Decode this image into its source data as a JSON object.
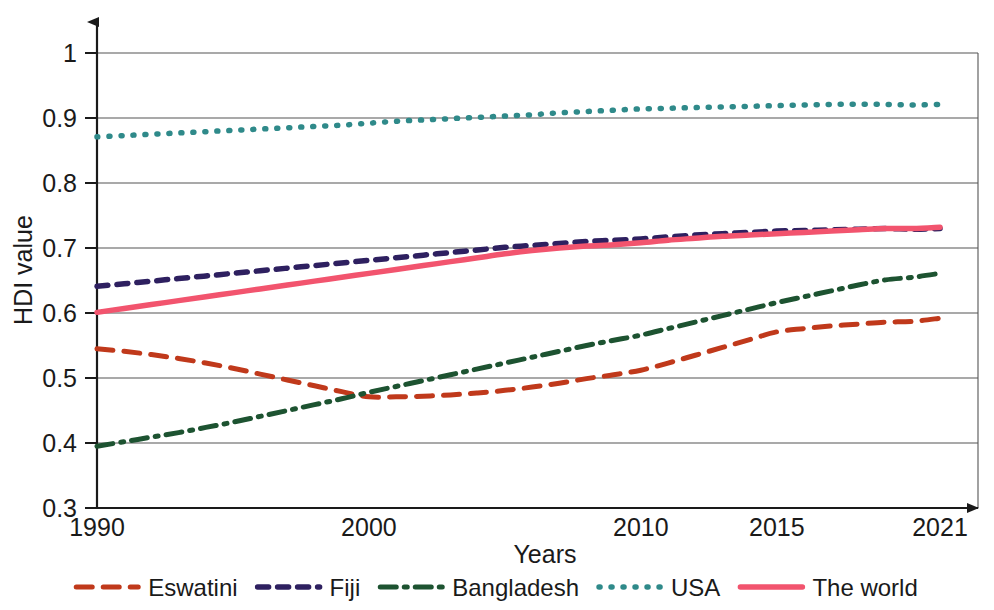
{
  "chart_data": {
    "type": "line",
    "title": "",
    "xlabel": "Years",
    "ylabel": "HDI value",
    "x": [
      1990,
      1991,
      1992,
      1993,
      1994,
      1995,
      1996,
      1997,
      1998,
      1999,
      2000,
      2001,
      2002,
      2003,
      2004,
      2005,
      2006,
      2007,
      2008,
      2009,
      2010,
      2011,
      2012,
      2013,
      2014,
      2015,
      2016,
      2017,
      2018,
      2019,
      2020,
      2021
    ],
    "x_tick_labels": [
      "1990",
      "2000",
      "2010",
      "2015",
      "2021"
    ],
    "x_tick_values": [
      1990,
      2000,
      2010,
      2015,
      2021
    ],
    "y_tick_labels": [
      "0.3",
      "0.4",
      "0.5",
      "0.6",
      "0.7",
      "0.8",
      "0.9",
      "1"
    ],
    "y_tick_values": [
      0.3,
      0.4,
      0.5,
      0.6,
      0.7,
      0.8,
      0.9,
      1.0
    ],
    "xlim": [
      1990,
      2021
    ],
    "ylim": [
      0.3,
      1.0
    ],
    "grid": true,
    "legend_position": "bottom",
    "series": [
      {
        "name": "Eswatini",
        "color": "#C0391B",
        "style": "dashed",
        "values": [
          0.545,
          0.541,
          0.536,
          0.53,
          0.523,
          0.515,
          0.506,
          0.497,
          0.488,
          0.479,
          0.471,
          0.471,
          0.472,
          0.474,
          0.477,
          0.481,
          0.486,
          0.492,
          0.499,
          0.505,
          0.512,
          0.523,
          0.535,
          0.547,
          0.559,
          0.571,
          0.576,
          0.58,
          0.583,
          0.586,
          0.587,
          0.592
        ]
      },
      {
        "name": "Fiji",
        "color": "#2E2060",
        "style": "dotted",
        "values": [
          0.641,
          0.645,
          0.649,
          0.653,
          0.657,
          0.661,
          0.665,
          0.669,
          0.673,
          0.677,
          0.681,
          0.685,
          0.689,
          0.693,
          0.697,
          0.701,
          0.704,
          0.707,
          0.71,
          0.712,
          0.714,
          0.717,
          0.72,
          0.722,
          0.724,
          0.726,
          0.727,
          0.728,
          0.729,
          0.73,
          0.729,
          0.73
        ]
      },
      {
        "name": "Bangladesh",
        "color": "#1D5331",
        "style": "dashdot",
        "values": [
          0.395,
          0.402,
          0.409,
          0.416,
          0.424,
          0.432,
          0.441,
          0.45,
          0.459,
          0.468,
          0.478,
          0.487,
          0.496,
          0.505,
          0.514,
          0.523,
          0.532,
          0.541,
          0.55,
          0.558,
          0.566,
          0.576,
          0.586,
          0.596,
          0.606,
          0.616,
          0.625,
          0.634,
          0.643,
          0.651,
          0.655,
          0.661
        ]
      },
      {
        "name": "USA",
        "color": "#2F8A8A",
        "style": "fine-dotted",
        "values": [
          0.871,
          0.873,
          0.875,
          0.877,
          0.879,
          0.881,
          0.883,
          0.885,
          0.887,
          0.889,
          0.892,
          0.895,
          0.897,
          0.899,
          0.901,
          0.903,
          0.905,
          0.908,
          0.91,
          0.912,
          0.914,
          0.915,
          0.916,
          0.917,
          0.918,
          0.919,
          0.92,
          0.921,
          0.921,
          0.921,
          0.92,
          0.921
        ]
      },
      {
        "name": "The world",
        "color": "#F2546E",
        "style": "solid",
        "values": [
          0.601,
          0.607,
          0.613,
          0.619,
          0.625,
          0.631,
          0.637,
          0.643,
          0.649,
          0.655,
          0.661,
          0.667,
          0.673,
          0.679,
          0.685,
          0.691,
          0.696,
          0.7,
          0.703,
          0.705,
          0.708,
          0.712,
          0.715,
          0.718,
          0.72,
          0.722,
          0.724,
          0.726,
          0.728,
          0.73,
          0.73,
          0.732
        ]
      }
    ]
  },
  "axes": {
    "y_title": "HDI value",
    "x_title": "Years"
  },
  "legend": {
    "items": [
      {
        "label": "Eswatini"
      },
      {
        "label": "Fiji"
      },
      {
        "label": "Bangladesh"
      },
      {
        "label": "USA"
      },
      {
        "label": "The world"
      }
    ]
  }
}
